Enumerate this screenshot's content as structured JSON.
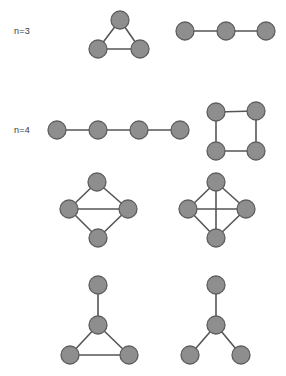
{
  "figure": {
    "background_color": "#ffffff",
    "node_fill_color": "#8e8e8e",
    "node_stroke_color": "#5e5e5e",
    "edge_color": "#565656",
    "node_radius": 9,
    "labels": [
      {
        "id": "label-n3",
        "text": "n=3",
        "x": 14,
        "y": 34
      },
      {
        "id": "label-n4",
        "text": "n=4",
        "x": 14,
        "y": 133
      }
    ],
    "graphs": [
      {
        "id": "graph-triangle-k3",
        "name": "triangle-k3",
        "n": 3,
        "nodes": [
          {
            "id": "t1",
            "x": 120,
            "y": 20
          },
          {
            "id": "t2",
            "x": 98,
            "y": 49
          },
          {
            "id": "t3",
            "x": 140,
            "y": 49
          }
        ],
        "edges": [
          {
            "from": "t1",
            "to": "t2"
          },
          {
            "from": "t1",
            "to": "t3"
          },
          {
            "from": "t2",
            "to": "t3"
          }
        ]
      },
      {
        "id": "graph-path-p3",
        "name": "path-p3",
        "n": 3,
        "nodes": [
          {
            "id": "p1",
            "x": 185,
            "y": 31
          },
          {
            "id": "p2",
            "x": 226,
            "y": 31
          },
          {
            "id": "p3",
            "x": 266,
            "y": 31
          }
        ],
        "edges": [
          {
            "from": "p1",
            "to": "p2"
          },
          {
            "from": "p2",
            "to": "p3"
          }
        ]
      },
      {
        "id": "graph-path-p4",
        "name": "path-p4",
        "n": 4,
        "nodes": [
          {
            "id": "q1",
            "x": 57,
            "y": 130
          },
          {
            "id": "q2",
            "x": 98,
            "y": 130
          },
          {
            "id": "q3",
            "x": 139,
            "y": 130
          },
          {
            "id": "q4",
            "x": 180,
            "y": 130
          }
        ],
        "edges": [
          {
            "from": "q1",
            "to": "q2"
          },
          {
            "from": "q2",
            "to": "q3"
          },
          {
            "from": "q3",
            "to": "q4"
          }
        ]
      },
      {
        "id": "graph-cycle-c4",
        "name": "cycle-c4-square",
        "n": 4,
        "nodes": [
          {
            "id": "c1",
            "x": 216,
            "y": 112
          },
          {
            "id": "c2",
            "x": 256,
            "y": 111
          },
          {
            "id": "c3",
            "x": 216,
            "y": 151
          },
          {
            "id": "c4",
            "x": 256,
            "y": 151
          }
        ],
        "edges": [
          {
            "from": "c1",
            "to": "c2"
          },
          {
            "from": "c2",
            "to": "c4"
          },
          {
            "from": "c4",
            "to": "c3"
          },
          {
            "from": "c3",
            "to": "c1"
          }
        ]
      },
      {
        "id": "graph-diamond",
        "name": "diamond",
        "n": 4,
        "nodes": [
          {
            "id": "d1",
            "x": 97,
            "y": 182
          },
          {
            "id": "d2",
            "x": 69,
            "y": 209
          },
          {
            "id": "d3",
            "x": 128,
            "y": 209
          },
          {
            "id": "d4",
            "x": 98,
            "y": 238
          }
        ],
        "edges": [
          {
            "from": "d1",
            "to": "d2"
          },
          {
            "from": "d1",
            "to": "d3"
          },
          {
            "from": "d2",
            "to": "d3"
          },
          {
            "from": "d2",
            "to": "d4"
          },
          {
            "from": "d3",
            "to": "d4"
          }
        ]
      },
      {
        "id": "graph-complete-k4",
        "name": "complete-k4",
        "n": 4,
        "nodes": [
          {
            "id": "k1",
            "x": 216,
            "y": 182
          },
          {
            "id": "k2",
            "x": 188,
            "y": 209
          },
          {
            "id": "k3",
            "x": 246,
            "y": 209
          },
          {
            "id": "k4",
            "x": 216,
            "y": 238
          }
        ],
        "edges": [
          {
            "from": "k1",
            "to": "k2"
          },
          {
            "from": "k1",
            "to": "k3"
          },
          {
            "from": "k1",
            "to": "k4"
          },
          {
            "from": "k2",
            "to": "k3"
          },
          {
            "from": "k2",
            "to": "k4"
          },
          {
            "from": "k3",
            "to": "k4"
          }
        ]
      },
      {
        "id": "graph-paw",
        "name": "paw-triangle-with-pendant",
        "n": 4,
        "nodes": [
          {
            "id": "w1",
            "x": 98,
            "y": 285
          },
          {
            "id": "w2",
            "x": 98,
            "y": 325
          },
          {
            "id": "w3",
            "x": 70,
            "y": 355
          },
          {
            "id": "w4",
            "x": 129,
            "y": 355
          }
        ],
        "edges": [
          {
            "from": "w1",
            "to": "w2"
          },
          {
            "from": "w2",
            "to": "w3"
          },
          {
            "from": "w2",
            "to": "w4"
          },
          {
            "from": "w3",
            "to": "w4"
          }
        ]
      },
      {
        "id": "graph-star-k13",
        "name": "star-k13",
        "n": 4,
        "nodes": [
          {
            "id": "s1",
            "x": 216,
            "y": 285
          },
          {
            "id": "s2",
            "x": 216,
            "y": 325
          },
          {
            "id": "s3",
            "x": 190,
            "y": 355
          },
          {
            "id": "s4",
            "x": 241,
            "y": 355
          }
        ],
        "edges": [
          {
            "from": "s1",
            "to": "s2"
          },
          {
            "from": "s2",
            "to": "s3"
          },
          {
            "from": "s2",
            "to": "s4"
          }
        ]
      }
    ]
  }
}
